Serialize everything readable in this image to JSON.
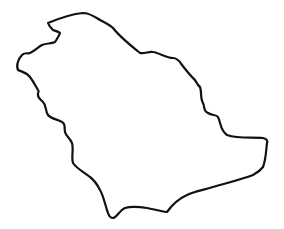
{
  "image": {
    "subject": "Outline map of Saudi Arabia",
    "stroke_color": "#111111",
    "background_color": "#ffffff",
    "stroke_width": 2.2
  }
}
